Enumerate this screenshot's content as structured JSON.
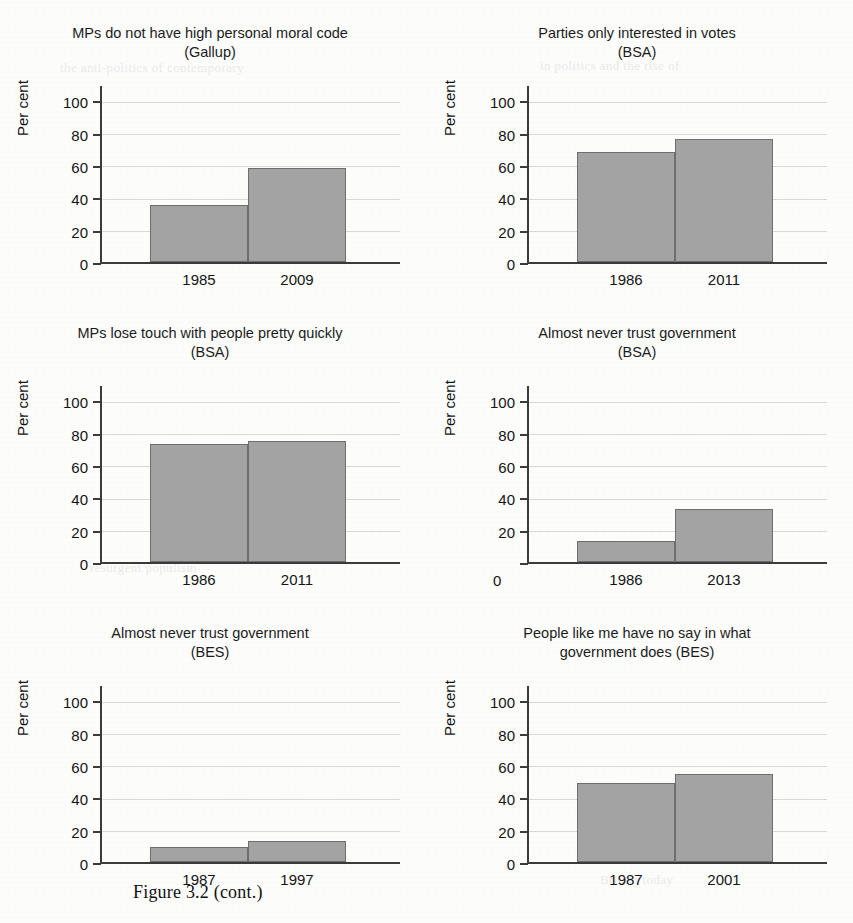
{
  "figure": {
    "caption": "Figure 3.2  (cont.)",
    "axis_title": "Per cent",
    "bar_color": "#a3a3a3",
    "bar_edge_color": "#6e6e6e",
    "axis_color": "#3b3b3b",
    "gridline_color": "#d8d8d6",
    "page_background": "#fdfdfc",
    "y_ticks": [
      "0",
      "20",
      "40",
      "60",
      "80",
      "100"
    ],
    "ylim": [
      0,
      110
    ],
    "displaced_zero_label": "0"
  },
  "bleed_through": [
    "the anti-politics of contemporary",
    "in politics and the rise of",
    "resurgent populism",
    "Britain today"
  ],
  "chart_data": [
    {
      "type": "bar",
      "title": "MPs do not have high personal moral code\n(Gallup)",
      "title_line1": "MPs do not have high personal moral code",
      "title_line2": "(Gallup)",
      "source": "Gallup",
      "categories": [
        "1985",
        "2009"
      ],
      "values": [
        35,
        58
      ],
      "xlabel": "",
      "ylabel": "Per cent",
      "ylim": [
        0,
        110
      ],
      "yticks": [
        0,
        20,
        40,
        60,
        80,
        100
      ],
      "grid": true,
      "legend": "none"
    },
    {
      "type": "bar",
      "title": "Parties only interested in votes\n(BSA)",
      "title_line1": "Parties only interested in votes",
      "title_line2": "(BSA)",
      "source": "BSA",
      "categories": [
        "1986",
        "2011"
      ],
      "values": [
        68,
        76
      ],
      "xlabel": "",
      "ylabel": "Per cent",
      "ylim": [
        0,
        110
      ],
      "yticks": [
        0,
        20,
        40,
        60,
        80,
        100
      ],
      "grid": true,
      "legend": "none"
    },
    {
      "type": "bar",
      "title": "MPs lose touch with people pretty quickly\n(BSA)",
      "title_line1": "MPs lose touch with people pretty quickly",
      "title_line2": "(BSA)",
      "source": "BSA",
      "categories": [
        "1986",
        "2011"
      ],
      "values": [
        73,
        74.5
      ],
      "xlabel": "",
      "ylabel": "Per cent",
      "ylim": [
        0,
        110
      ],
      "yticks": [
        0,
        20,
        40,
        60,
        80,
        100
      ],
      "grid": true,
      "legend": "none"
    },
    {
      "type": "bar",
      "title": "Almost never trust government\n(BSA)",
      "title_line1": "Almost never trust government",
      "title_line2": "(BSA)",
      "source": "BSA",
      "categories": [
        "1986",
        "2013"
      ],
      "values": [
        13,
        33
      ],
      "xlabel": "",
      "ylabel": "Per cent",
      "ylim": [
        0,
        110
      ],
      "yticks": [
        0,
        20,
        40,
        60,
        80,
        100
      ],
      "grid": true,
      "legend": "none"
    },
    {
      "type": "bar",
      "title": "Almost never trust government\n(BES)",
      "title_line1": "Almost never trust government",
      "title_line2": "(BES)",
      "source": "BES",
      "categories": [
        "1987",
        "1997"
      ],
      "values": [
        9.5,
        13
      ],
      "xlabel": "",
      "ylabel": "Per cent",
      "ylim": [
        0,
        110
      ],
      "yticks": [
        0,
        20,
        40,
        60,
        80,
        100
      ],
      "grid": true,
      "legend": "none"
    },
    {
      "type": "bar",
      "title": "People like me have no say in what\ngovernment does (BES)",
      "title_line1": "People like me have no say in what",
      "title_line2": "government does (BES)",
      "source": "BES",
      "categories": [
        "1987",
        "2001"
      ],
      "values": [
        49,
        54.5
      ],
      "xlabel": "",
      "ylabel": "Per cent",
      "ylim": [
        0,
        110
      ],
      "yticks": [
        0,
        20,
        40,
        60,
        80,
        100
      ],
      "grid": true,
      "legend": "none"
    }
  ]
}
